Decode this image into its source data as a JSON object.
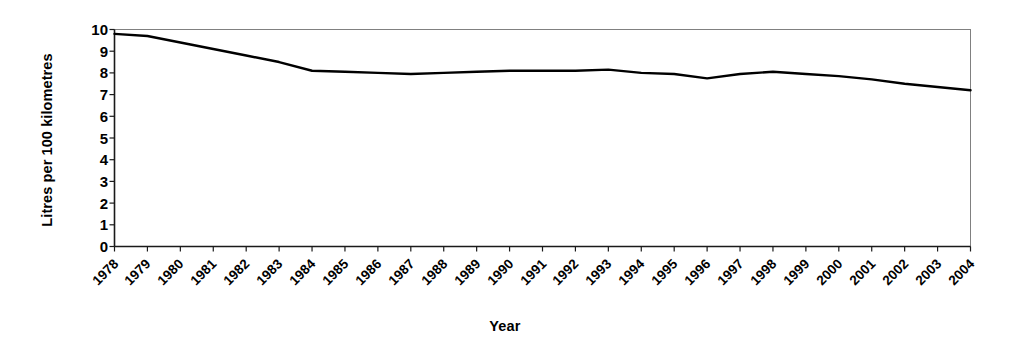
{
  "chart_data": {
    "type": "line",
    "title": "",
    "xlabel": "Year",
    "ylabel": "Litres per 100 kilometres",
    "xlim": [
      1978,
      2004
    ],
    "ylim": [
      0,
      10
    ],
    "ytick_step": 1,
    "grid": false,
    "legend": "none",
    "line_color": "#000000",
    "line_width": 2.4,
    "plot_border_color": "#808080",
    "axis_color": "#000000",
    "categories": [
      "1978",
      "1979",
      "1980",
      "1981",
      "1982",
      "1983",
      "1984",
      "1985",
      "1986",
      "1987",
      "1988",
      "1989",
      "1990",
      "1991",
      "1992",
      "1993",
      "1994",
      "1995",
      "1996",
      "1997",
      "1998",
      "1999",
      "2000",
      "2001",
      "2002",
      "2003",
      "2004"
    ],
    "x": [
      1978,
      1979,
      1980,
      1981,
      1982,
      1983,
      1984,
      1985,
      1986,
      1987,
      1988,
      1989,
      1990,
      1991,
      1992,
      1993,
      1994,
      1995,
      1996,
      1997,
      1998,
      1999,
      2000,
      2001,
      2002,
      2003,
      2004
    ],
    "series": [
      {
        "name": "Average fuel consumption",
        "values": [
          9.8,
          9.7,
          9.4,
          9.1,
          8.8,
          8.5,
          8.1,
          8.05,
          8.0,
          7.95,
          8.0,
          8.05,
          8.1,
          8.1,
          8.1,
          8.15,
          8.0,
          7.95,
          7.75,
          7.95,
          8.05,
          7.95,
          7.85,
          7.7,
          7.5,
          7.35,
          7.2
        ]
      }
    ],
    "ytick_labels": [
      "10",
      "9",
      "8",
      "7",
      "6",
      "5",
      "4",
      "3",
      "2",
      "1",
      "0"
    ],
    "ytick_values": [
      10,
      9,
      8,
      7,
      6,
      5,
      4,
      3,
      2,
      1,
      0
    ]
  }
}
